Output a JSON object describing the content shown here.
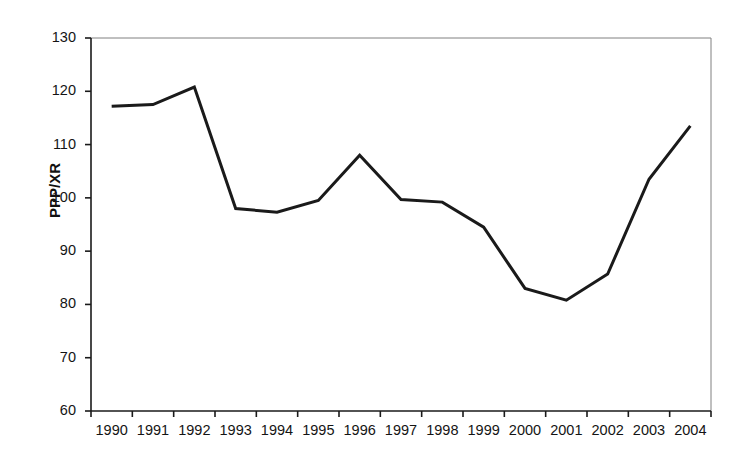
{
  "chart_data": {
    "type": "line",
    "title": "",
    "xlabel": "",
    "ylabel": "PPP/XR",
    "categories": [
      "1990",
      "1991",
      "1992",
      "1993",
      "1994",
      "1995",
      "1996",
      "1997",
      "1998",
      "1999",
      "2000",
      "2001",
      "2002",
      "2003",
      "2004"
    ],
    "values": [
      117.2,
      117.5,
      120.8,
      98.0,
      97.3,
      99.5,
      108.0,
      99.7,
      99.2,
      94.5,
      83.0,
      80.8,
      85.7,
      103.5,
      113.5
    ],
    "series": [
      {
        "name": "PPP/XR",
        "values": [
          117.2,
          117.5,
          120.8,
          98.0,
          97.3,
          99.5,
          108.0,
          99.7,
          99.2,
          94.5,
          83.0,
          80.8,
          85.7,
          103.5,
          113.5
        ]
      }
    ],
    "ylim": [
      60,
      130
    ],
    "yticks": [
      130,
      120,
      110,
      100,
      90,
      80,
      70,
      60
    ],
    "ytick_labels": [
      "130",
      "120",
      "110",
      "100",
      "90",
      "80",
      "70",
      "60"
    ],
    "grid": false,
    "legend": false,
    "legend_position": "none",
    "line_color": "#1a1a1a",
    "line_width": 3,
    "axis_color": "#000000",
    "background": "#ffffff"
  },
  "axes": {
    "y_axis_title": "PPP/XR"
  }
}
